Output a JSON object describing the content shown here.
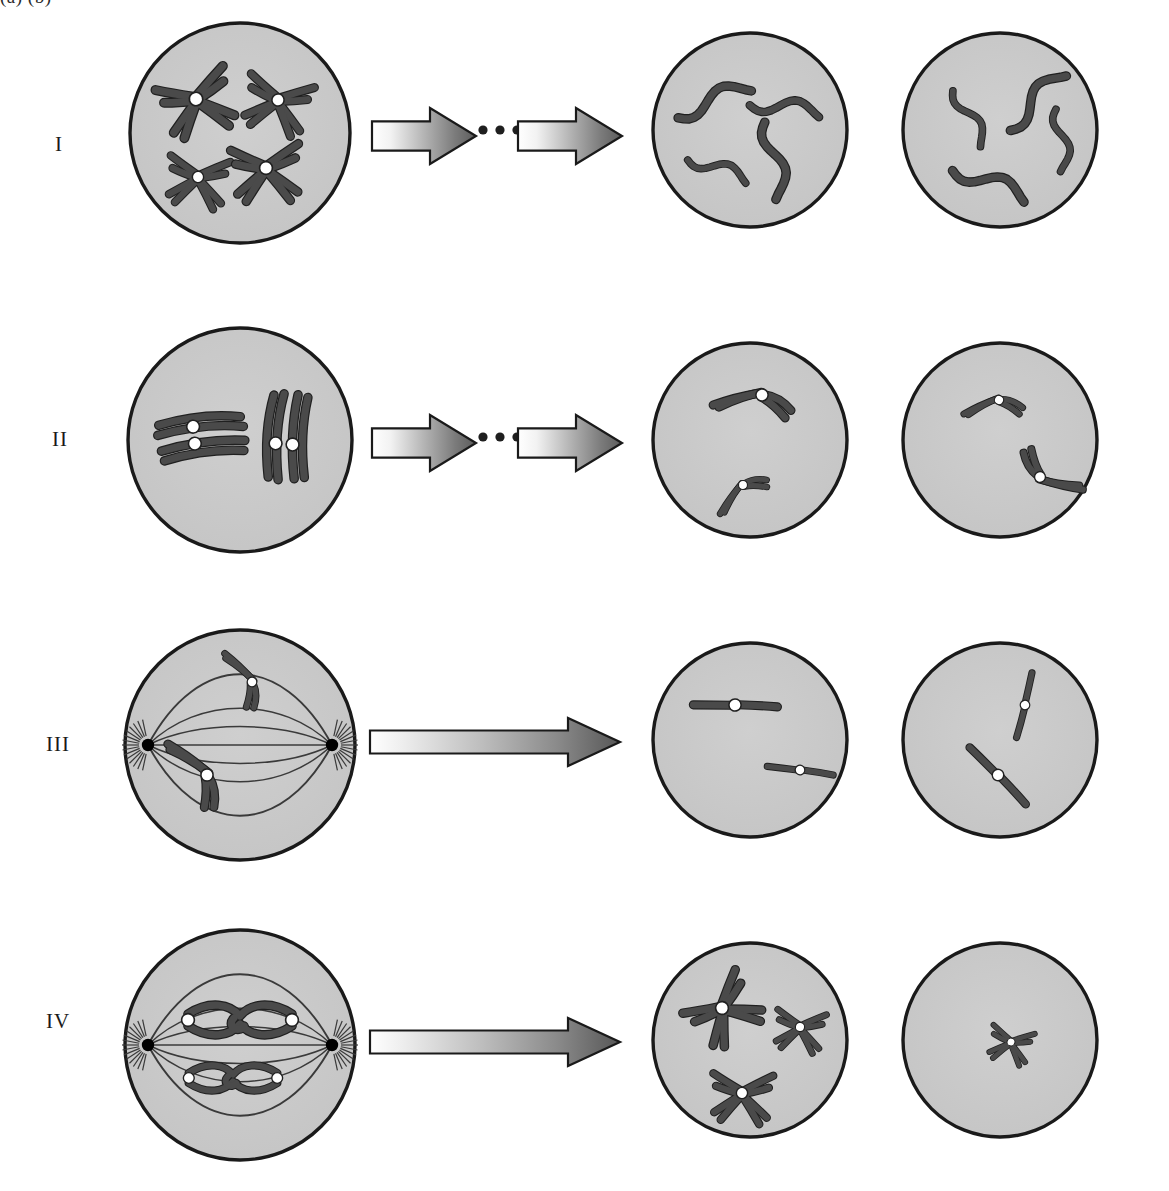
{
  "figure": {
    "title_fragment_clipped": "(a)        (b)",
    "background_color": "#ffffff",
    "cell_fill_color": "#c9c9c9",
    "cell_stroke_color": "#1a1a1a",
    "chromosome_color": "#4a4a4a",
    "chromosome_outline_color": "#202020",
    "centromere_color": "#ffffff",
    "centrosome_color": "#000000",
    "spindle_color": "#3a3a3a",
    "arrow_light_color": "#fdfdfd",
    "arrow_dark_color": "#5e5e5e",
    "arrow_outline_color": "#1a1a1a"
  },
  "rows": [
    {
      "label": "I",
      "label_x": 55,
      "label_y": 145,
      "arrow_style": "double-with-ellipsis",
      "cells": [
        {
          "name": "row-i-cell-1",
          "cx": 240,
          "cy": 133,
          "r": 110,
          "type": "interphase-duplicated",
          "chromosome_count": 4,
          "chromosome_form": "duplicated-x",
          "has_centromere_dots": true,
          "has_spindle": false,
          "chromosomes": [
            {
              "x": 196,
              "y": 99,
              "rot": -18,
              "scale": 1.05,
              "form": "x"
            },
            {
              "x": 278,
              "y": 100,
              "rot": 14,
              "scale": 0.95,
              "form": "x"
            },
            {
              "x": 198,
              "y": 177,
              "rot": 8,
              "scale": 0.88,
              "form": "x"
            },
            {
              "x": 266,
              "y": 168,
              "rot": -4,
              "scale": 1.0,
              "form": "x"
            }
          ]
        },
        {
          "name": "row-i-cell-2",
          "cx": 750,
          "cy": 130,
          "r": 97,
          "type": "daughter",
          "chromosome_count": 4,
          "chromosome_form": "single-wavy",
          "has_centromere_dots": false,
          "has_spindle": false,
          "chromosomes": [
            {
              "x": 713,
              "y": 100,
              "rot": -22,
              "scale": 1.0,
              "form": "wavy"
            },
            {
              "x": 785,
              "y": 107,
              "rot": 8,
              "scale": 0.9,
              "form": "wavy"
            },
            {
              "x": 718,
              "y": 168,
              "rot": 20,
              "scale": 0.8,
              "form": "wavy"
            },
            {
              "x": 775,
              "y": 160,
              "rot": 80,
              "scale": 1.0,
              "form": "wavy"
            }
          ]
        },
        {
          "name": "row-i-cell-3",
          "cx": 1000,
          "cy": 130,
          "r": 97,
          "type": "daughter",
          "chromosome_count": 4,
          "chromosome_form": "single-wavy",
          "has_centromere_dots": false,
          "has_spindle": false,
          "chromosomes": [
            {
              "x": 970,
              "y": 117,
              "rot": 62,
              "scale": 0.8,
              "form": "wavy"
            },
            {
              "x": 1035,
              "y": 100,
              "rot": -46,
              "scale": 1.0,
              "form": "wavy"
            },
            {
              "x": 1062,
              "y": 140,
              "rot": 84,
              "scale": 0.8,
              "form": "wavy"
            },
            {
              "x": 990,
              "y": 182,
              "rot": 22,
              "scale": 1.0,
              "form": "wavy"
            }
          ]
        }
      ]
    },
    {
      "label": "II",
      "label_x": 52,
      "label_y": 440,
      "arrow_style": "double-with-ellipsis",
      "cells": [
        {
          "name": "row-ii-cell-1",
          "cx": 240,
          "cy": 440,
          "r": 112,
          "type": "synapsis",
          "chromosome_count": 2,
          "chromosome_form": "bivalent-tetrad",
          "has_centromere_dots": true,
          "has_spindle": false,
          "chromosomes": [
            {
              "x": 200,
              "y": 435,
              "rot": 84,
              "scale": 1.0,
              "form": "tetrad"
            },
            {
              "x": 285,
              "y": 438,
              "rot": 4,
              "scale": 1.0,
              "form": "tetrad"
            }
          ]
        },
        {
          "name": "row-ii-cell-2",
          "cx": 750,
          "cy": 440,
          "r": 97,
          "type": "daughter",
          "chromosome_count": 2,
          "chromosome_form": "duplicated-v",
          "has_centromere_dots": true,
          "has_spindle": false,
          "chromosomes": [
            {
              "x": 762,
              "y": 395,
              "rot": 128,
              "scale": 0.95,
              "form": "v"
            },
            {
              "x": 743,
              "y": 485,
              "rot": 88,
              "scale": 0.7,
              "form": "v"
            }
          ]
        },
        {
          "name": "row-ii-cell-3",
          "cx": 1000,
          "cy": 440,
          "r": 97,
          "type": "daughter",
          "chromosome_count": 2,
          "chromosome_form": "duplicated-v",
          "has_centromere_dots": true,
          "has_spindle": false,
          "chromosomes": [
            {
              "x": 999,
              "y": 400,
              "rot": 118,
              "scale": 0.72,
              "form": "v"
            },
            {
              "x": 1040,
              "y": 477,
              "rot": -24,
              "scale": 0.85,
              "form": "v"
            }
          ]
        }
      ]
    },
    {
      "label": "III",
      "label_x": 46,
      "label_y": 745,
      "arrow_style": "single-long",
      "cells": [
        {
          "name": "row-iii-cell-1",
          "cx": 240,
          "cy": 745,
          "r": 115,
          "type": "anaphase-spindle",
          "chromosome_count": 2,
          "chromosome_form": "duplicated-v",
          "has_centromere_dots": true,
          "has_spindle": true,
          "chromosomes": [
            {
              "x": 252,
              "y": 682,
              "rot": 186,
              "scale": 0.75,
              "form": "v"
            },
            {
              "x": 207,
              "y": 775,
              "rot": 178,
              "scale": 0.95,
              "form": "v"
            }
          ]
        },
        {
          "name": "row-iii-cell-2",
          "cx": 750,
          "cy": 740,
          "r": 97,
          "type": "daughter",
          "chromosome_count": 2,
          "chromosome_form": "single-with-centromere",
          "has_centromere_dots": true,
          "has_spindle": false,
          "chromosomes": [
            {
              "x": 735,
              "y": 705,
              "rot": -24,
              "scale": 0.95,
              "form": "single"
            },
            {
              "x": 800,
              "y": 770,
              "rot": -18,
              "scale": 0.75,
              "form": "single"
            }
          ]
        },
        {
          "name": "row-iii-cell-3",
          "cx": 1000,
          "cy": 740,
          "r": 97,
          "type": "daughter",
          "chromosome_count": 2,
          "chromosome_form": "single-with-centromere",
          "has_centromere_dots": true,
          "has_spindle": false,
          "chromosomes": [
            {
              "x": 1025,
              "y": 705,
              "rot": 78,
              "scale": 0.75,
              "form": "single"
            },
            {
              "x": 998,
              "y": 775,
              "rot": 20,
              "scale": 0.9,
              "form": "single"
            }
          ]
        }
      ]
    },
    {
      "label": "IV",
      "label_x": 46,
      "label_y": 1022,
      "arrow_style": "single-long",
      "cells": [
        {
          "name": "row-iv-cell-1",
          "cx": 240,
          "cy": 1045,
          "r": 115,
          "type": "metaphase-i-spindle",
          "chromosome_count": 2,
          "chromosome_form": "bivalent-plate",
          "has_centromere_dots": true,
          "has_spindle": true,
          "chromosomes": [
            {
              "x": 240,
              "y": 1020,
              "rot": 0,
              "scale": 1.0,
              "form": "plate"
            },
            {
              "x": 233,
              "y": 1078,
              "rot": 0,
              "scale": 0.85,
              "form": "plate"
            }
          ]
        },
        {
          "name": "row-iv-cell-2",
          "cx": 750,
          "cy": 1040,
          "r": 97,
          "type": "daughter",
          "chromosome_count": 3,
          "chromosome_form": "duplicated-x",
          "has_centromere_dots": true,
          "has_spindle": false,
          "chromosomes": [
            {
              "x": 722,
              "y": 1008,
              "rot": -38,
              "scale": 1.0,
              "form": "x"
            },
            {
              "x": 800,
              "y": 1027,
              "rot": 8,
              "scale": 0.72,
              "form": "x"
            },
            {
              "x": 742,
              "y": 1093,
              "rot": 4,
              "scale": 0.88,
              "form": "x"
            }
          ]
        },
        {
          "name": "row-iv-cell-3",
          "cx": 1000,
          "cy": 1040,
          "r": 97,
          "type": "daughter",
          "chromosome_count": 1,
          "chromosome_form": "duplicated-x",
          "has_centromere_dots": true,
          "has_spindle": false,
          "chromosomes": [
            {
              "x": 1011,
              "y": 1042,
              "rot": 14,
              "scale": 0.62,
              "form": "x"
            }
          ]
        }
      ]
    }
  ],
  "arrows": [
    {
      "name": "row-i-arrow-1",
      "row": "I",
      "x": 372,
      "y": 108,
      "width": 104,
      "height": 56,
      "style": "gradient-block"
    },
    {
      "name": "row-i-ellipsis",
      "row": "I",
      "x": 483,
      "y": 130,
      "dots": 3,
      "style": "ellipsis"
    },
    {
      "name": "row-i-arrow-2",
      "row": "I",
      "x": 518,
      "y": 108,
      "width": 104,
      "height": 56,
      "style": "gradient-block"
    },
    {
      "name": "row-ii-arrow-1",
      "row": "II",
      "x": 372,
      "y": 415,
      "width": 104,
      "height": 56,
      "style": "gradient-block"
    },
    {
      "name": "row-ii-ellipsis",
      "row": "II",
      "x": 483,
      "y": 437,
      "dots": 3,
      "style": "ellipsis"
    },
    {
      "name": "row-ii-arrow-2",
      "row": "II",
      "x": 518,
      "y": 415,
      "width": 104,
      "height": 56,
      "style": "gradient-block"
    },
    {
      "name": "row-iii-arrow",
      "row": "III",
      "x": 370,
      "y": 718,
      "width": 250,
      "height": 48,
      "style": "gradient-long"
    },
    {
      "name": "row-iv-arrow",
      "row": "IV",
      "x": 370,
      "y": 1018,
      "width": 250,
      "height": 48,
      "style": "gradient-long"
    }
  ]
}
